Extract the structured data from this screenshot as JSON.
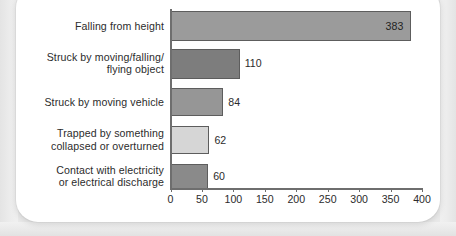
{
  "chart_data": {
    "type": "bar",
    "orientation": "horizontal",
    "title": "",
    "xlabel": "",
    "ylabel": "",
    "xlim": [
      0,
      400
    ],
    "xticks": [
      0,
      50,
      100,
      150,
      200,
      250,
      300,
      350,
      400
    ],
    "grid": false,
    "legend": null,
    "categories": [
      "Falling from height",
      "Struck by moving/falling/ flying object",
      "Struck by moving vehicle",
      "Trapped by something collapsed or overturned",
      "Contact with electricity or electrical discharge"
    ],
    "values": [
      383,
      110,
      84,
      62,
      60
    ],
    "value_labels": [
      "383",
      "110",
      "84",
      "62",
      "60"
    ],
    "bar_colors": [
      "#9b9b9b",
      "#7d7d7d",
      "#969696",
      "#d6d6d6",
      "#8a8a8a"
    ],
    "bar_border_color": "#5d5d5d",
    "axis_color": "#6e6e6e",
    "text_color": "#2c2c2c"
  },
  "categories_display": [
    {
      "line1": "Falling from height",
      "line2": ""
    },
    {
      "line1": "Struck by moving/falling/",
      "line2": "flying object"
    },
    {
      "line1": "Struck by moving vehicle",
      "line2": ""
    },
    {
      "line1": "Trapped by something",
      "line2": "collapsed or overturned"
    },
    {
      "line1": "Contact with electricity",
      "line2": "or electrical discharge"
    }
  ],
  "tick_labels": [
    "0",
    "50",
    "100",
    "150",
    "200",
    "250",
    "300",
    "350",
    "400"
  ]
}
